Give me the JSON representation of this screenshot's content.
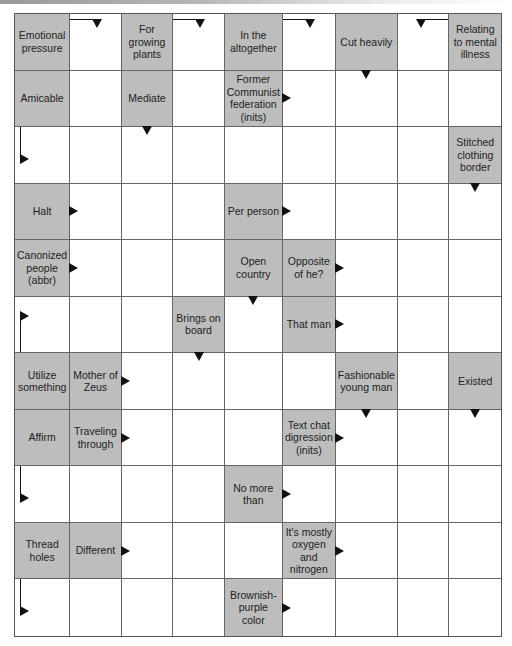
{
  "puzzle": {
    "type": "arrow-crossword",
    "columns": 9,
    "rows": 11,
    "colors": {
      "clue_background": "#bdbdbd",
      "answer_background": "#ffffff",
      "grid_line": "#666666",
      "arrow": "#111111"
    },
    "cells": [
      [
        {
          "kind": "clue",
          "text": "Emotional pressure"
        },
        {
          "kind": "answer",
          "bent": "top-right-down"
        },
        {
          "kind": "clue",
          "text": "For growing plants"
        },
        {
          "kind": "answer",
          "bent": "top-right-down"
        },
        {
          "kind": "clue",
          "text": "In the altogether"
        },
        {
          "kind": "answer",
          "bent": "top-right-down"
        },
        {
          "kind": "clue",
          "text": "Cut heavily",
          "arrow": "down"
        },
        {
          "kind": "answer",
          "bent": "from-right-down"
        },
        {
          "kind": "clue",
          "text": "Relating to mental illness"
        }
      ],
      [
        {
          "kind": "clue",
          "text": "Amicable"
        },
        {
          "kind": "answer"
        },
        {
          "kind": "clue",
          "text": "Mediate",
          "arrow": "down"
        },
        {
          "kind": "answer"
        },
        {
          "kind": "clue",
          "text": "Former Communist federation (inits)",
          "arrow": "right"
        },
        {
          "kind": "answer"
        },
        {
          "kind": "answer"
        },
        {
          "kind": "answer"
        },
        {
          "kind": "answer"
        }
      ],
      [
        {
          "kind": "answer",
          "bent": "top-down-right"
        },
        {
          "kind": "answer"
        },
        {
          "kind": "answer"
        },
        {
          "kind": "answer"
        },
        {
          "kind": "answer"
        },
        {
          "kind": "answer"
        },
        {
          "kind": "answer"
        },
        {
          "kind": "answer"
        },
        {
          "kind": "clue",
          "text": "Stitched clothing border",
          "arrow": "down"
        }
      ],
      [
        {
          "kind": "clue",
          "text": "Halt",
          "arrow": "right"
        },
        {
          "kind": "answer"
        },
        {
          "kind": "answer"
        },
        {
          "kind": "answer"
        },
        {
          "kind": "clue",
          "text": "Per person",
          "arrow": "right"
        },
        {
          "kind": "answer"
        },
        {
          "kind": "answer"
        },
        {
          "kind": "answer"
        },
        {
          "kind": "answer"
        }
      ],
      [
        {
          "kind": "clue",
          "text": "Canonized people (abbr)",
          "arrow": "right"
        },
        {
          "kind": "answer"
        },
        {
          "kind": "answer"
        },
        {
          "kind": "answer"
        },
        {
          "kind": "clue",
          "text": "Open country",
          "arrow": "down"
        },
        {
          "kind": "clue",
          "text": "Opposite of he?",
          "arrow": "right"
        },
        {
          "kind": "answer"
        },
        {
          "kind": "answer"
        },
        {
          "kind": "answer"
        }
      ],
      [
        {
          "kind": "answer",
          "bent": "bottom-up-right"
        },
        {
          "kind": "answer"
        },
        {
          "kind": "answer"
        },
        {
          "kind": "clue",
          "text": "Brings on board",
          "arrow": "down"
        },
        {
          "kind": "answer"
        },
        {
          "kind": "clue",
          "text": "That man",
          "arrow": "right"
        },
        {
          "kind": "answer"
        },
        {
          "kind": "answer"
        },
        {
          "kind": "answer"
        }
      ],
      [
        {
          "kind": "clue",
          "text": "Utilize something"
        },
        {
          "kind": "clue",
          "text": "Mother of Zeus",
          "arrow": "right"
        },
        {
          "kind": "answer"
        },
        {
          "kind": "answer"
        },
        {
          "kind": "answer"
        },
        {
          "kind": "answer"
        },
        {
          "kind": "clue",
          "text": "Fashionable young man",
          "arrow": "down"
        },
        {
          "kind": "answer"
        },
        {
          "kind": "clue",
          "text": "Existed",
          "arrow": "down"
        }
      ],
      [
        {
          "kind": "clue",
          "text": "Affirm"
        },
        {
          "kind": "clue",
          "text": "Traveling through",
          "arrow": "right"
        },
        {
          "kind": "answer"
        },
        {
          "kind": "answer"
        },
        {
          "kind": "answer"
        },
        {
          "kind": "clue",
          "text": "Text chat digression (inits)",
          "arrow": "right"
        },
        {
          "kind": "answer"
        },
        {
          "kind": "answer"
        },
        {
          "kind": "answer"
        }
      ],
      [
        {
          "kind": "answer",
          "bent": "top-down-right"
        },
        {
          "kind": "answer"
        },
        {
          "kind": "answer"
        },
        {
          "kind": "answer"
        },
        {
          "kind": "clue",
          "text": "No more than",
          "arrow": "right"
        },
        {
          "kind": "answer"
        },
        {
          "kind": "answer"
        },
        {
          "kind": "answer"
        },
        {
          "kind": "answer"
        }
      ],
      [
        {
          "kind": "clue",
          "text": "Thread holes"
        },
        {
          "kind": "clue",
          "text": "Different",
          "arrow": "right"
        },
        {
          "kind": "answer"
        },
        {
          "kind": "answer"
        },
        {
          "kind": "answer"
        },
        {
          "kind": "clue",
          "text": "It's mostly oxygen and nitrogen",
          "arrow": "right"
        },
        {
          "kind": "answer"
        },
        {
          "kind": "answer"
        },
        {
          "kind": "answer"
        }
      ],
      [
        {
          "kind": "answer",
          "bent": "top-down-right"
        },
        {
          "kind": "answer"
        },
        {
          "kind": "answer"
        },
        {
          "kind": "answer"
        },
        {
          "kind": "clue",
          "text": "Brownish-purple color",
          "arrow": "right"
        },
        {
          "kind": "answer"
        },
        {
          "kind": "answer"
        },
        {
          "kind": "answer"
        },
        {
          "kind": "answer"
        }
      ]
    ]
  }
}
